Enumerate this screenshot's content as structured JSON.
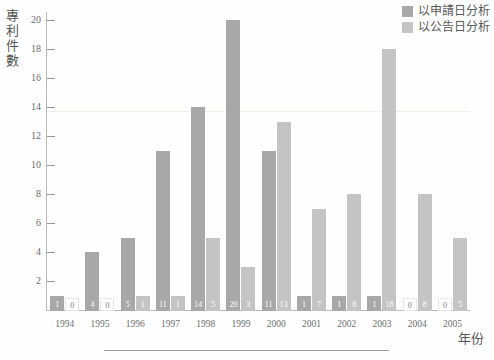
{
  "chart_data": {
    "type": "bar",
    "title": "",
    "xlabel": "年份",
    "ylabel": "專利件數",
    "categories": [
      "1994",
      "1995",
      "1996",
      "1997",
      "1998",
      "1999",
      "2000",
      "2001",
      "2002",
      "2003",
      "2004",
      "2005"
    ],
    "series": [
      {
        "name": "以申請日分析",
        "color": "#a8a8a8",
        "values": [
          1,
          4,
          5,
          11,
          14,
          20,
          11,
          1,
          1,
          1,
          0,
          0
        ]
      },
      {
        "name": "以公告日分析",
        "color": "#c4c4c4",
        "values": [
          0,
          0,
          1,
          1,
          5,
          3,
          13,
          7,
          8,
          18,
          8,
          5
        ]
      }
    ],
    "ylim": [
      0,
      20
    ],
    "yticks": [
      2,
      4,
      6,
      8,
      10,
      12,
      14,
      16,
      18,
      20
    ],
    "ytick_labels": [
      "2",
      "4",
      "6",
      "8",
      "10",
      "12",
      "14",
      "16",
      "18",
      "20"
    ],
    "grid": false,
    "legend_position": "top-right",
    "data_labels_shown": true
  },
  "legend": {
    "items": [
      {
        "label": "以申請日分析",
        "color": "#a8a8a8"
      },
      {
        "label": "以公告日分析",
        "color": "#c4c4c4"
      }
    ]
  },
  "axes": {
    "y_title_chars": [
      "專",
      "利",
      "件",
      "數"
    ],
    "x_title": "年份"
  },
  "colors": {
    "series_applied": "#a8a8a8",
    "series_published": "#c4c4c4",
    "axis": "#b9b9b9",
    "tick": "#9a9a9a",
    "text": "#6a6a6a",
    "background": "#fefefe"
  }
}
